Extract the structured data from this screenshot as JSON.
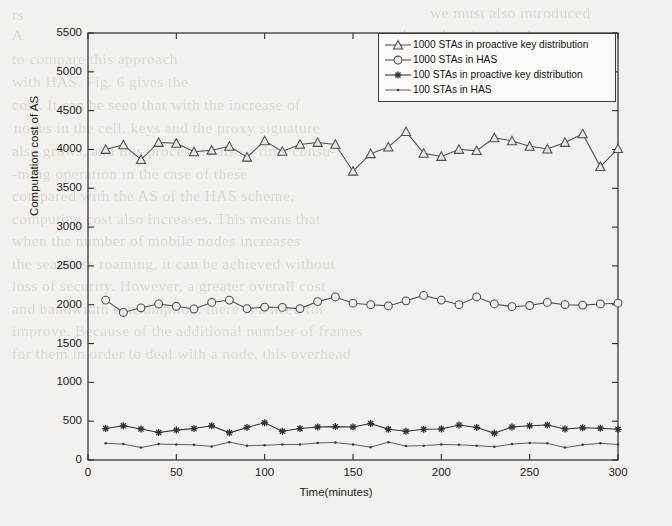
{
  "figure": {
    "xlabel": "Time(minutes)",
    "ylabel": "Computation cost of AS",
    "xticks": [
      "0",
      "50",
      "100",
      "150",
      "200",
      "250",
      "300"
    ],
    "yticks": [
      "0",
      "500",
      "1000",
      "1500",
      "2000",
      "2500",
      "3000",
      "3500",
      "4000",
      "4500",
      "5000",
      "5500"
    ],
    "legend": [
      {
        "label": "1000 STAs in proactive key distribution",
        "marker": "triangle-marker"
      },
      {
        "label": "1000 STAs in HAS",
        "marker": "circle-marker"
      },
      {
        "label": "100 STAs in proactive key distribution",
        "marker": "asterisk-marker"
      },
      {
        "label": "100 STAs in HAS",
        "marker": "dot-marker"
      }
    ],
    "line_color": "#4d4d4d",
    "axis_color": "#2b2b2b",
    "background": "#f3f1ee"
  },
  "bleed_text": [
    {
      "x": 12,
      "y": 6,
      "text": "rs"
    },
    {
      "x": 430,
      "y": 4,
      "text": "we must also introduced"
    },
    {
      "x": 12,
      "y": 26,
      "text": "A"
    },
    {
      "x": 398,
      "y": 26,
      "text": "the authentication. As a"
    },
    {
      "x": 12,
      "y": 50,
      "text": "to compare this approach"
    },
    {
      "x": 392,
      "y": 50,
      "text": "by PKfTC computation for"
    },
    {
      "x": 12,
      "y": 73,
      "text": "with HAS. Fig. 6 gives the"
    },
    {
      "x": 398,
      "y": 73,
      "text": "additional expenses"
    },
    {
      "x": 12,
      "y": 96,
      "text": "cost. It can be seen that with the increase of"
    },
    {
      "x": 14,
      "y": 119,
      "text": "nodes in the cell, keys and the proxy signature"
    },
    {
      "x": 12,
      "y": 142,
      "text": "also grows, and this process is also a time consu-"
    },
    {
      "x": 12,
      "y": 165,
      "text": "-ming operation in the case of these"
    },
    {
      "x": 12,
      "y": 187,
      "text": "compared with the AS of the HAS scheme,"
    },
    {
      "x": 12,
      "y": 210,
      "text": "computing cost also increases. This means that"
    },
    {
      "x": 12,
      "y": 232,
      "text": "when the number of mobile nodes increases"
    },
    {
      "x": 12,
      "y": 255,
      "text": "the  seamless roaming, it can be achieved without"
    },
    {
      "x": 12,
      "y": 277,
      "text": "loss of security. However, a greater overall cost"
    },
    {
      "x": 12,
      "y": 300,
      "text": "and bandwidth consumption, there is a need for"
    },
    {
      "x": 12,
      "y": 322,
      "text": "improve. Because of the additional number of frames"
    },
    {
      "x": 12,
      "y": 345,
      "text": "for them in order to deal with a node, this overhead"
    }
  ],
  "chart_data": {
    "type": "line",
    "title": "",
    "xlabel": "Time(minutes)",
    "ylabel": "Computation cost of AS",
    "xlim": [
      0,
      300
    ],
    "ylim": [
      0,
      5500
    ],
    "xticks": [
      0,
      50,
      100,
      150,
      200,
      250,
      300
    ],
    "yticks": [
      0,
      500,
      1000,
      1500,
      2000,
      2500,
      3000,
      3500,
      4000,
      4500,
      5000,
      5500
    ],
    "grid": false,
    "legend_position": "upper-right",
    "x": [
      10,
      20,
      30,
      40,
      50,
      60,
      70,
      80,
      90,
      100,
      110,
      120,
      130,
      140,
      150,
      160,
      170,
      180,
      190,
      200,
      210,
      220,
      230,
      240,
      250,
      260,
      270,
      280,
      290,
      300
    ],
    "series": [
      {
        "name": "1000 STAs in proactive key distribution",
        "marker": "triangle",
        "values": [
          4000,
          4060,
          3870,
          4090,
          4080,
          3970,
          3990,
          4040,
          3900,
          4110,
          3975,
          4065,
          4090,
          4065,
          3720,
          3945,
          4030,
          4230,
          3950,
          3910,
          4000,
          3985,
          4150,
          4110,
          4040,
          4005,
          4090,
          4200,
          3780,
          4010
        ]
      },
      {
        "name": "1000 STAs in HAS",
        "marker": "circle",
        "values": [
          2060,
          1900,
          1960,
          2010,
          1980,
          1945,
          2030,
          2060,
          1950,
          1970,
          1965,
          1950,
          2040,
          2100,
          2020,
          2000,
          1985,
          2050,
          2120,
          2060,
          2000,
          2100,
          2010,
          1975,
          1990,
          2030,
          2000,
          1995,
          2010,
          2020
        ]
      },
      {
        "name": "100 STAs in proactive key distribution",
        "marker": "asterisk",
        "values": [
          405,
          440,
          400,
          355,
          385,
          405,
          440,
          350,
          420,
          480,
          370,
          405,
          425,
          430,
          425,
          470,
          395,
          370,
          395,
          400,
          450,
          420,
          345,
          425,
          440,
          450,
          400,
          415,
          410,
          395
        ]
      },
      {
        "name": "100 STAs in HAS",
        "marker": "dot",
        "values": [
          215,
          205,
          160,
          205,
          200,
          195,
          175,
          230,
          185,
          190,
          200,
          200,
          220,
          225,
          200,
          165,
          230,
          180,
          185,
          200,
          195,
          185,
          170,
          205,
          220,
          215,
          160,
          195,
          215,
          200
        ]
      }
    ]
  }
}
